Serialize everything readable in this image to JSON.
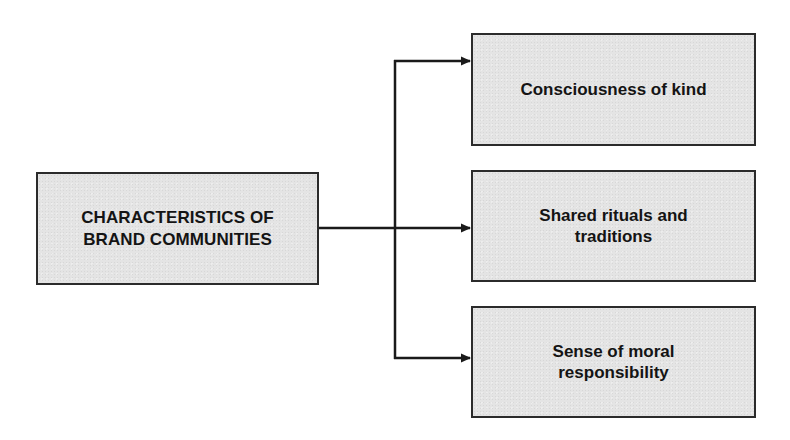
{
  "diagram": {
    "type": "hierarchy",
    "root": {
      "label_line1": "CHARACTERISTICS OF",
      "label_line2": "BRAND COMMUNITIES"
    },
    "children": [
      {
        "label_line1": "Consciousness of kind",
        "label_line2": ""
      },
      {
        "label_line1": "Shared rituals and",
        "label_line2": "traditions"
      },
      {
        "label_line1": "Sense of moral",
        "label_line2": "responsibility"
      }
    ],
    "edges": [
      {
        "from": "root",
        "to": "children.0"
      },
      {
        "from": "root",
        "to": "children.1"
      },
      {
        "from": "root",
        "to": "children.2"
      }
    ],
    "colors": {
      "box_fill": "#e4e4e4",
      "box_border": "#2b2b2b",
      "text": "#141414",
      "connector": "#1a1a1a"
    }
  }
}
